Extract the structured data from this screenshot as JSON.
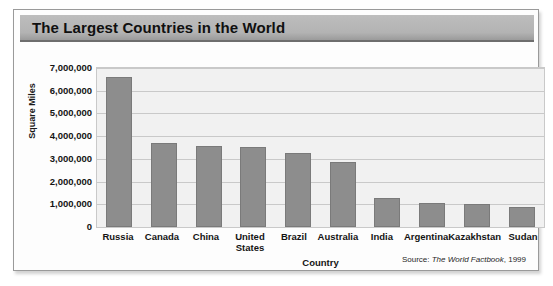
{
  "title": "The Largest Countries in the World",
  "source": {
    "prefix": "Source:",
    "publication": "The World Factbook",
    "year": ", 1999"
  },
  "chart_data": {
    "type": "bar",
    "title": "The Largest Countries in the World",
    "xlabel": "Country",
    "ylabel": "Square Miles",
    "ylim": [
      0,
      7000000
    ],
    "grid": true,
    "legend": "none",
    "ytick_labels": [
      "7,000,000",
      "6,000,000",
      "5,000,000",
      "4,000,000",
      "3,000,000",
      "2,000,000",
      "1,000,000",
      "0"
    ],
    "ytick_values": [
      7000000,
      6000000,
      5000000,
      4000000,
      3000000,
      2000000,
      1000000,
      0
    ],
    "categories": [
      "Russia",
      "Canada",
      "China",
      "United States",
      "Brazil",
      "Australia",
      "India",
      "Argentina",
      "Kazakhstan",
      "Sudan"
    ],
    "category_lines": [
      [
        "Russia"
      ],
      [
        "Canada"
      ],
      [
        "China"
      ],
      [
        "United",
        "States"
      ],
      [
        "Brazil"
      ],
      [
        "Australia"
      ],
      [
        "India"
      ],
      [
        "Argentina"
      ],
      [
        "Kazakhstan"
      ],
      [
        "Sudan"
      ]
    ],
    "values": [
      6590000,
      3690000,
      3550000,
      3540000,
      3260000,
      2850000,
      1270000,
      1070000,
      1030000,
      900000
    ],
    "bar_color": "#8d8d8d",
    "plot_background": "#f1f1f1",
    "gridline_color": "#c9c9c9"
  }
}
